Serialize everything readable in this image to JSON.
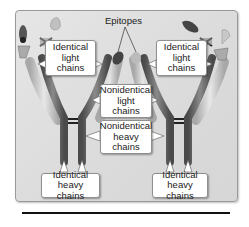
{
  "diagram": {
    "type": "antibody-structure-illustration",
    "labels": {
      "epitopes": "Epitopes",
      "identical_light_left": [
        "Identical",
        "light",
        "chains"
      ],
      "identical_light_right": [
        "Identical",
        "light",
        "chains"
      ],
      "nonidentical_light": [
        "Nonidentical",
        "light",
        "chains"
      ],
      "nonidentical_heavy": [
        "Nonidentical",
        "heavy",
        "chains"
      ],
      "identical_heavy_left": [
        "Identical",
        "heavy chains"
      ],
      "identical_heavy_right": [
        "Identical",
        "heavy chains"
      ]
    },
    "colors": {
      "frame_bg": "#dedede",
      "heavy_chain": "#6f6f6f",
      "light_chain": "#c8c8c8",
      "antigen_dark": "#3a3a3a",
      "label_bg": "#ffffff"
    }
  }
}
